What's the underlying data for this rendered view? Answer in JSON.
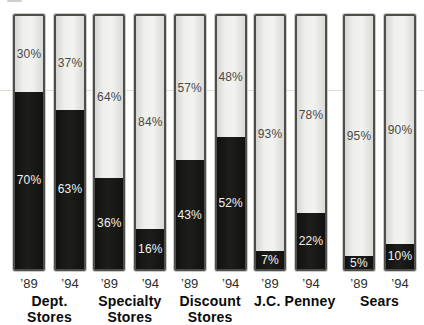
{
  "figure": {
    "background": "#ffffff",
    "colors": {
      "bar_fill_light": "#ededeb",
      "bar_fill_dark": "#171716",
      "bar_border": "#4e4e4b",
      "bar_outer_edge": "#cbcbc8",
      "pct_label_dark": "#4a4a47",
      "pct_label_light": "#f2f2ef",
      "year_label": "#2d2d2b",
      "group_label": "#0a0a0a",
      "gridline": "#dcdcd9"
    }
  },
  "chart_data": {
    "type": "bar",
    "variant": "100pct-stacked-column-pairs",
    "unit": "%",
    "ylim": [
      0,
      100
    ],
    "grid": false,
    "legend": false,
    "title": "",
    "xlabel": "",
    "ylabel": "",
    "segment_names": [
      "top-light",
      "bottom-black"
    ],
    "groups": [
      {
        "label": "Dept. Stores",
        "label_lines": [
          "Dept.",
          "Stores"
        ],
        "bars": [
          {
            "year": "’89",
            "top_value": 30,
            "top_label": "30%",
            "bottom_value": 70,
            "bottom_label": "70%"
          },
          {
            "year": "’94",
            "top_value": 37,
            "top_label": "37%",
            "bottom_value": 63,
            "bottom_label": "63%"
          }
        ]
      },
      {
        "label": "Specialty Stores",
        "label_lines": [
          "Specialty",
          "Stores"
        ],
        "bars": [
          {
            "year": "’89",
            "top_value": 64,
            "top_label": "64%",
            "bottom_value": 36,
            "bottom_label": "36%"
          },
          {
            "year": "’94",
            "top_value": 84,
            "top_label": "84%",
            "bottom_value": 16,
            "bottom_label": "16%"
          }
        ]
      },
      {
        "label": "Discount Stores",
        "label_lines": [
          "Discount",
          "Stores"
        ],
        "bars": [
          {
            "year": "’89",
            "top_value": 57,
            "top_label": "57%",
            "bottom_value": 43,
            "bottom_label": "43%"
          },
          {
            "year": "’94",
            "top_value": 48,
            "top_label": "48%",
            "bottom_value": 52,
            "bottom_label": "52%"
          }
        ]
      },
      {
        "label": "J.C. Penney",
        "label_lines": [
          "J.C. Penney"
        ],
        "bars": [
          {
            "year": "’89",
            "top_value": 93,
            "top_label": "93%",
            "bottom_value": 7,
            "bottom_label": "7%"
          },
          {
            "year": "’94",
            "top_value": 78,
            "top_label": "78%",
            "bottom_value": 22,
            "bottom_label": "22%"
          }
        ]
      },
      {
        "label": "Sears",
        "label_lines": [
          "Sears"
        ],
        "bars": [
          {
            "year": "’89",
            "top_value": 95,
            "top_label": "95%",
            "bottom_value": 5,
            "bottom_label": "5%"
          },
          {
            "year": "’94",
            "top_value": 90,
            "top_label": "90%",
            "bottom_value": 10,
            "bottom_label": "10%"
          }
        ]
      }
    ]
  }
}
